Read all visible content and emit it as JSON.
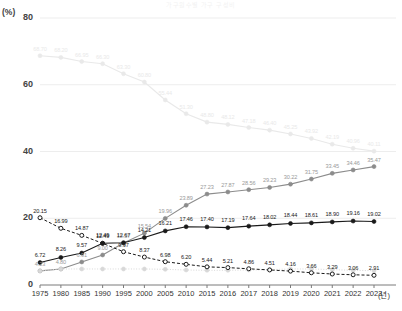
{
  "chart_data": {
    "type": "line",
    "title": "가구원수별 가구 구성비",
    "xlabel": "(년)",
    "ylabel": "(%)",
    "ylim": [
      0,
      80
    ],
    "yticks": [
      0,
      20,
      40,
      60,
      80
    ],
    "grid": true,
    "legend": "none",
    "categories": [
      "1975",
      "1980",
      "1985",
      "1990",
      "1995",
      "2000",
      "2005",
      "2010",
      "2015",
      "2016",
      "2017",
      "2018",
      "2019",
      "2020",
      "2021",
      "2022",
      "2023"
    ],
    "series": [
      {
        "name": "4인 이상 가구",
        "color": "#e9e9e9",
        "style": "solid",
        "values": [
          68.7,
          68.2,
          66.95,
          66.3,
          63.3,
          60.8,
          55.44,
          51.3,
          48.8,
          48.12,
          47.18,
          46.4,
          45.25,
          43.92,
          42.19,
          40.96,
          40.11
        ]
      },
      {
        "name": "1인 가구",
        "color": "#8c8c8c",
        "style": "solid",
        "values": [
          4.23,
          4.8,
          6.91,
          9.0,
          12.57,
          15.54,
          19.96,
          23.89,
          27.23,
          27.87,
          28.56,
          29.23,
          30.22,
          31.75,
          33.45,
          34.46,
          35.47
        ]
      },
      {
        "name": "2인 가구",
        "color": "#1a1a1a",
        "style": "solid",
        "values": [
          6.72,
          8.26,
          9.57,
          12.49,
          12.67,
          14.21,
          16.21,
          17.46,
          17.4,
          17.19,
          17.64,
          18.02,
          18.44,
          18.61,
          18.9,
          19.16,
          19.02
        ]
      },
      {
        "name": "5인 이상 가구",
        "color": "#1a1a1a",
        "style": "dashed",
        "values": [
          20.15,
          16.99,
          14.87,
          12.49,
          9.97,
          8.37,
          6.98,
          6.2,
          5.44,
          5.21,
          4.86,
          4.51,
          4.16,
          3.66,
          3.29,
          3.06,
          2.91
        ]
      },
      {
        "name": "기타 가구",
        "color": "#d8d8d8",
        "style": "dotted",
        "values": [
          4.23,
          4.8,
          4.8,
          4.8,
          4.8,
          4.8,
          4.7,
          4.5,
          4.4,
          4.4,
          4.5,
          4.6,
          4.8,
          4.8,
          4.6,
          4.4,
          4.3
        ]
      }
    ],
    "value_labels": {
      "top_line": [
        "68.70",
        "68.20",
        "66.95",
        "66.30",
        "63.30",
        "60.80",
        "55.44",
        "51.30",
        "48.80",
        "48.12",
        "47.18",
        "46.40",
        "45.25",
        "43.92",
        "42.19",
        "40.96",
        "40.11"
      ],
      "rise_line": [
        "4.23",
        "4.80",
        "6.91",
        "9.00",
        "12.57",
        "15.54",
        "19.96",
        "23.89",
        "27.23",
        "27.87",
        "28.56",
        "29.23",
        "30.22",
        "31.75",
        "33.45",
        "34.46",
        "35.47"
      ],
      "solid_line": [
        "6.72",
        "8.26",
        "9.57",
        "12.49",
        "12.67",
        "14.21",
        "16.21",
        "17.46",
        "17.40",
        "17.19",
        "17.64",
        "18.02",
        "18.44",
        "18.61",
        "18.90",
        "19.16",
        "19.02"
      ],
      "dash_line": [
        "20.15",
        "16.99",
        "14.87",
        "12.49",
        "9.97",
        "8.37",
        "6.98",
        "6.20",
        "5.44",
        "5.21",
        "4.86",
        "4.51",
        "4.16",
        "3.66",
        "3.29",
        "3.06",
        "2.91"
      ]
    }
  },
  "axis": {
    "unit_y": "(%)",
    "unit_x": "(년)",
    "yticks": [
      "80",
      "60",
      "40",
      "20",
      "0"
    ],
    "xticks": [
      "1975",
      "1980",
      "1985",
      "1990",
      "1995",
      "2000",
      "2005",
      "2010",
      "2015",
      "2016",
      "2017",
      "2018",
      "2019",
      "2020",
      "2021",
      "2022",
      "2023"
    ]
  }
}
